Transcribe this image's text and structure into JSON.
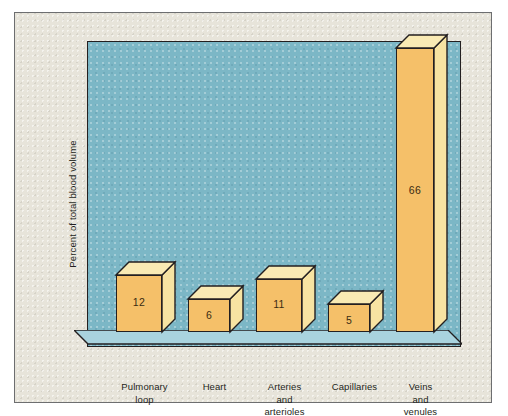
{
  "figure": {
    "panel_background": "#e7e4da",
    "plot_background": "#7cb7c6",
    "floor_color": "#a9d3de",
    "bar_front_color": "#f5c069",
    "bar_side_color": "#f7e3a2",
    "bar_top_color": "#f9eab4",
    "outline_color": "#231f20"
  },
  "chart_data": {
    "type": "bar",
    "title": "",
    "subtitle": "",
    "xlabel": "",
    "ylabel": "Percent of total blood volume",
    "categories": [
      "Pulmonary loop",
      "Heart",
      "Arteries and arterioles",
      "Capillaries",
      "Veins and venules"
    ],
    "category_lines": [
      [
        "Pulmonary",
        "loop"
      ],
      [
        "Heart"
      ],
      [
        "Arteries",
        "and",
        "arterioles"
      ],
      [
        "Capillaries"
      ],
      [
        "Veins",
        "and",
        "venules"
      ]
    ],
    "values": [
      12,
      6,
      11,
      5,
      66
    ],
    "value_labels": [
      "12",
      "6",
      "11",
      "5",
      "66"
    ],
    "ylim": [
      0,
      70
    ],
    "grid": false,
    "legend": null,
    "units": "percent",
    "style": "3d-bar"
  }
}
